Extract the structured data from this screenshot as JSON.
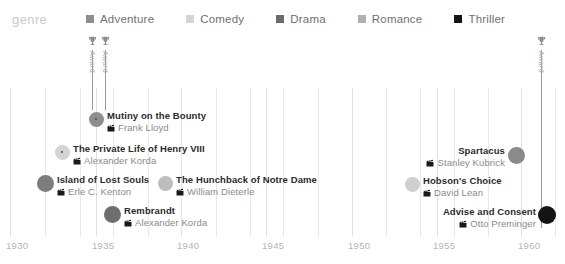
{
  "legend": {
    "title": "genre",
    "items": [
      {
        "label": "Adventure",
        "color": "#8e8e8e"
      },
      {
        "label": "Comedy",
        "color": "#d4d4d4"
      },
      {
        "label": "Drama",
        "color": "#6b6b6b"
      },
      {
        "label": "Romance",
        "color": "#b0b0b0"
      },
      {
        "label": "Thriller",
        "color": "#151515"
      }
    ]
  },
  "annotations": [
    {
      "name": "award-marker-1",
      "label": "Award",
      "icon": "trophy-icon",
      "x": 92,
      "top": 36,
      "stem_height": 60
    },
    {
      "name": "award-marker-2",
      "label": "Award",
      "icon": "trophy-icon",
      "x": 105,
      "top": 36,
      "stem_height": 60
    },
    {
      "name": "award-marker-3",
      "label": "Award",
      "icon": "trophy-icon",
      "x": 541,
      "top": 36,
      "stem_height": 178
    }
  ],
  "chart_data": {
    "type": "scatter",
    "title": "",
    "xlabel": "",
    "ylabel": "",
    "xlim": [
      1929.0,
      1961.5
    ],
    "grid": true,
    "legend_position": "top",
    "legend_title": "genre",
    "series_key": "genre",
    "categories": [
      "Adventure",
      "Comedy",
      "Drama",
      "Romance",
      "Thriller"
    ],
    "xticks": [
      1930,
      1935,
      1940,
      1945,
      1950,
      1955,
      1960
    ],
    "xtick_labels": [
      "1930",
      "1935",
      "1940",
      "1945",
      "1950",
      "1955",
      "1960"
    ],
    "points": [
      {
        "title": "Mutiny on the Bounty",
        "director": "Frank Lloyd",
        "genre": "Adventure",
        "color": "#8e8e8e",
        "year": 1935,
        "px": 96,
        "py": 119,
        "radius": 7.5,
        "has_core": true,
        "label_side": "right",
        "label_x": 107,
        "label_y": 110
      },
      {
        "title": "The Private Life of Henry VIII",
        "director": "Alexander Korda",
        "genre": "Comedy",
        "color": "#d4d4d4",
        "year": 1933,
        "px": 62,
        "py": 152,
        "radius": 7.5,
        "has_core": true,
        "label_side": "right",
        "label_x": 73,
        "label_y": 143
      },
      {
        "title": "Island of Lost Souls",
        "director": "Erle C. Kenton",
        "genre": "Drama",
        "color": "#7c7c7c",
        "year": 1932,
        "px": 45,
        "py": 183,
        "radius": 8.5,
        "has_core": false,
        "label_side": "right",
        "label_x": 57,
        "label_y": 174
      },
      {
        "title": "The Hunchback of Notre Dame",
        "director": "William Dieterle",
        "genre": "Romance",
        "color": "#bdbdbd",
        "year": 1939,
        "px": 165,
        "py": 183,
        "radius": 7.5,
        "label_side": "right",
        "has_core": false,
        "label_x": 176,
        "label_y": 174
      },
      {
        "title": "Rembrandt",
        "director": "Alexander Korda",
        "genre": "Drama",
        "color": "#6e6e6e",
        "year": 1936,
        "px": 112,
        "py": 214,
        "radius": 8.5,
        "has_core": false,
        "label_side": "right",
        "label_x": 124,
        "label_y": 205
      },
      {
        "title": "Spartacus",
        "director": "Stanley Kubrick",
        "genre": "Adventure",
        "color": "#8a8a8a",
        "year": 1960,
        "px": 516,
        "py": 155,
        "radius": 8.5,
        "has_core": false,
        "label_side": "left",
        "label_x": 505,
        "label_y": 145
      },
      {
        "title": "Hobson's Choice",
        "director": "David Lean",
        "genre": "Comedy",
        "color": "#cfcfcf",
        "year": 1954,
        "px": 412,
        "py": 184,
        "radius": 7.5,
        "has_core": false,
        "label_side": "right",
        "label_x": 423,
        "label_y": 175
      },
      {
        "title": "Advise and Consent",
        "director": "Otto Preminger",
        "genre": "Thriller",
        "color": "#141414",
        "year": 1962,
        "px": 547,
        "py": 215,
        "radius": 9,
        "has_core": false,
        "label_side": "left",
        "label_x": 536,
        "label_y": 206
      }
    ],
    "gridlines_px": [
      10,
      45,
      80,
      113,
      148,
      181,
      216,
      250,
      283,
      318,
      352,
      386,
      420,
      454,
      488,
      521,
      555
    ],
    "major_gridlines_px": [
      10,
      96,
      181,
      266,
      352,
      437,
      521
    ]
  },
  "xaxis": {
    "ticks": [
      {
        "label": "1930",
        "px": 6
      },
      {
        "label": "1935",
        "px": 92
      },
      {
        "label": "1940",
        "px": 177
      },
      {
        "label": "1945",
        "px": 262
      },
      {
        "label": "1950",
        "px": 348
      },
      {
        "label": "1955",
        "px": 433
      },
      {
        "label": "1960",
        "px": 518
      }
    ]
  }
}
